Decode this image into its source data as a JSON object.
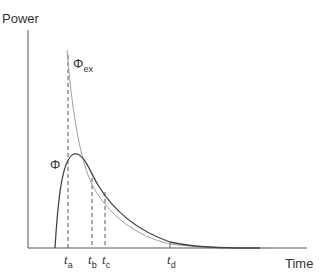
{
  "axes": {
    "y_label": "Power",
    "x_label": "Time"
  },
  "curves": {
    "phi": {
      "symbol": "Φ",
      "color": "#444444"
    },
    "phi_ex": {
      "symbol": "Φ",
      "subscript": "ex",
      "color": "#999999"
    }
  },
  "time_markers": [
    {
      "symbol": "t",
      "subscript": "a"
    },
    {
      "symbol": "t",
      "subscript": "b"
    },
    {
      "symbol": "t",
      "subscript": "c"
    },
    {
      "symbol": "t",
      "subscript": "d"
    }
  ]
}
